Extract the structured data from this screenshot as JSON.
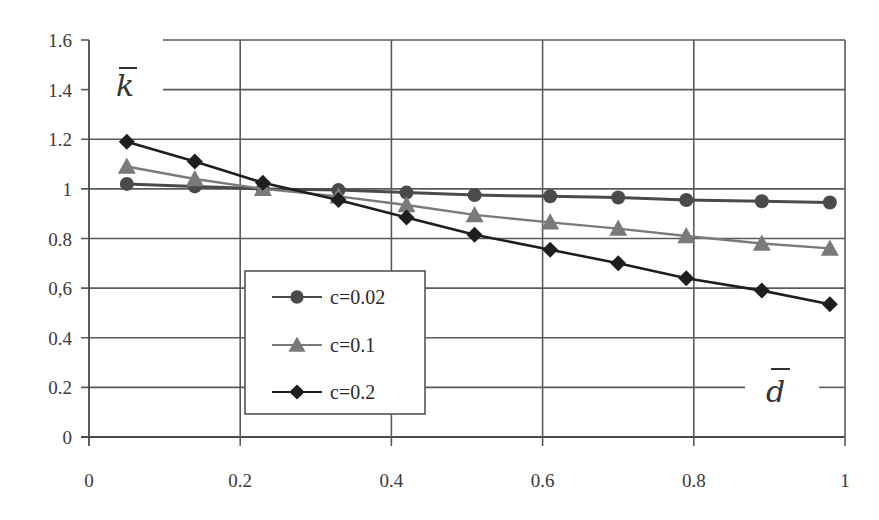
{
  "chart_data": {
    "type": "line",
    "title": "",
    "xlabel": "d̄",
    "ylabel": "k̄",
    "x_label_text": "d",
    "y_label_text": "k",
    "xlim": [
      0,
      1
    ],
    "ylim": [
      0,
      1.6
    ],
    "grid": true,
    "legend_position": "inside-lower-left-center",
    "x_ticks": [
      "0",
      "0.2",
      "0.4",
      "0.6",
      "0.8",
      "1"
    ],
    "y_ticks": [
      "0",
      "0.2",
      "0.4",
      "0,6",
      "0.8",
      "1",
      "1.2",
      "1.4",
      "1.6"
    ],
    "x": [
      0.05,
      0.14,
      0.23,
      0.33,
      0.42,
      0.51,
      0.61,
      0.7,
      0.79,
      0.89,
      0.98
    ],
    "series": [
      {
        "name": "c=0.02",
        "marker": "circle",
        "color": "#4a4a4a",
        "values": [
          1.02,
          1.01,
          1.0,
          0.995,
          0.985,
          0.975,
          0.97,
          0.965,
          0.955,
          0.95,
          0.945
        ]
      },
      {
        "name": "c=0.1",
        "marker": "triangle",
        "color": "#7a7a7a",
        "values": [
          1.09,
          1.04,
          1.0,
          0.97,
          0.935,
          0.895,
          0.865,
          0.84,
          0.81,
          0.78,
          0.76
        ]
      },
      {
        "name": "c=0.2",
        "marker": "diamond",
        "color": "#1e1e1e",
        "values": [
          1.19,
          1.11,
          1.025,
          0.955,
          0.885,
          0.815,
          0.755,
          0.7,
          0.64,
          0.59,
          0.535
        ]
      }
    ]
  },
  "legend": {
    "items": [
      {
        "label": "c=0.02",
        "marker": "circle"
      },
      {
        "label": "c=0.1",
        "marker": "triangle"
      },
      {
        "label": "c=0.2",
        "marker": "diamond"
      }
    ]
  }
}
